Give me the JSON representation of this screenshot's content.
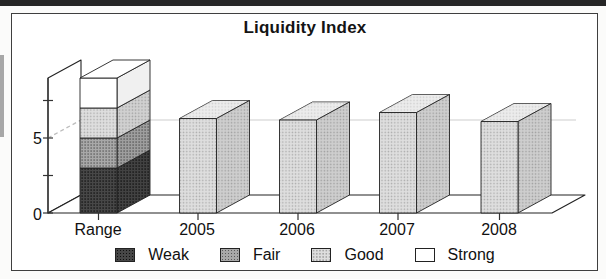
{
  "title": "Liquidity Index",
  "chart_data": {
    "type": "bar",
    "projection": "3d",
    "title": "Liquidity Index",
    "categories": [
      "Range",
      "2005",
      "2006",
      "2007",
      "2008"
    ],
    "stacked_range_bar": {
      "category": "Range",
      "segments": [
        {
          "label": "Weak",
          "value": 3.0
        },
        {
          "label": "Fair",
          "value": 2.0
        },
        {
          "label": "Good",
          "value": 2.0
        },
        {
          "label": "Strong",
          "value": 2.0
        }
      ],
      "total": 9.0
    },
    "year_values": [
      {
        "category": "2005",
        "value": 6.3,
        "segment": "Good"
      },
      {
        "category": "2006",
        "value": 6.2,
        "segment": "Good"
      },
      {
        "category": "2007",
        "value": 6.7,
        "segment": "Good"
      },
      {
        "category": "2008",
        "value": 6.1,
        "segment": "Good"
      }
    ],
    "ylim": [
      0,
      9
    ],
    "yticks": [
      0,
      2.5,
      5,
      7.5
    ],
    "ytick_labels": [
      "0",
      "5"
    ],
    "gridline_value": 5,
    "grid": "dashed-at-5-on-wall",
    "legend": {
      "position": "bottom",
      "items": [
        {
          "label": "Weak",
          "color": "#474747"
        },
        {
          "label": "Fair",
          "color": "#a8a8a8"
        },
        {
          "label": "Good",
          "color": "#dedede"
        },
        {
          "label": "Strong",
          "color": "#ffffff"
        }
      ]
    }
  }
}
